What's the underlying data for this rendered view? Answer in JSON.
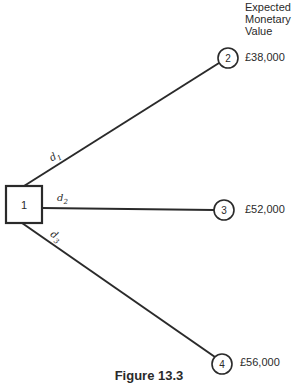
{
  "diagram": {
    "type": "decision-tree",
    "header": "Expected\nMonetary\nValue",
    "caption": "Figure 13.3",
    "decision_node": {
      "id": "1",
      "label": "1"
    },
    "branches": [
      {
        "label": "d",
        "subscript": "1",
        "to": "2"
      },
      {
        "label": "d",
        "subscript": "2",
        "to": "3"
      },
      {
        "label": "d",
        "subscript": "3",
        "to": "4"
      }
    ],
    "outcome_nodes": [
      {
        "id": "2",
        "label": "2",
        "emv": "£38,000"
      },
      {
        "id": "3",
        "label": "3",
        "emv": "£52,000"
      },
      {
        "id": "4",
        "label": "4",
        "emv": "£56,000"
      }
    ]
  }
}
